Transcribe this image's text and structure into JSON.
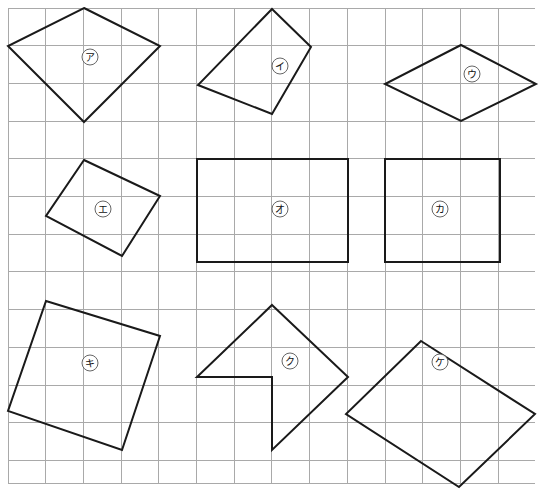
{
  "figure": {
    "background_color": "#ffffff",
    "grid": {
      "line_color": "#a9a9a9",
      "cell_size": 37.7,
      "origin_x": 8,
      "origin_y": 8,
      "columns": 14,
      "rows": 12.6,
      "width": 527,
      "height": 475
    },
    "stroke_color": "#1a1a1a",
    "stroke_width": 2
  },
  "shapes": [
    {
      "id": "shape-a",
      "label": "ア",
      "label_x": 90,
      "label_y": 57,
      "closed": true,
      "points": "84,8 160,46 84,122 8,46",
      "description": "kite-diamond"
    },
    {
      "id": "shape-i",
      "label": "イ",
      "label_x": 280,
      "label_y": 66,
      "closed": true,
      "points": "272,9 311,47 272,114 198,85"
    },
    {
      "id": "shape-u",
      "label": "ウ",
      "label_x": 472,
      "label_y": 74,
      "closed": true,
      "points": "461,45 536,84 461,121 385,84"
    },
    {
      "id": "shape-e",
      "label": "エ",
      "label_x": 103,
      "label_y": 209,
      "closed": true,
      "points": "84,160 160,196 122,256 46,216"
    },
    {
      "id": "shape-o",
      "label": "オ",
      "label_x": 280,
      "label_y": 209,
      "closed": true,
      "points": "197,159 348,159 348,262 197,262"
    },
    {
      "id": "shape-ka",
      "label": "カ",
      "label_x": 440,
      "label_y": 209,
      "closed": true,
      "points": "385,159 500,159 500,262 385,262"
    },
    {
      "id": "shape-ki",
      "label": "キ",
      "label_x": 90,
      "label_y": 363,
      "closed": true,
      "points": "46,301 160,336 122,450 8,411"
    },
    {
      "id": "shape-ku",
      "label": "ク",
      "label_x": 290,
      "label_y": 361,
      "closed": true,
      "points": "272,305 348,377 272,450 272,377 197,377"
    },
    {
      "id": "shape-ke",
      "label": "ケ",
      "label_x": 440,
      "label_y": 362,
      "closed": true,
      "points": "421,341 535,414 459,487 346,414"
    }
  ]
}
